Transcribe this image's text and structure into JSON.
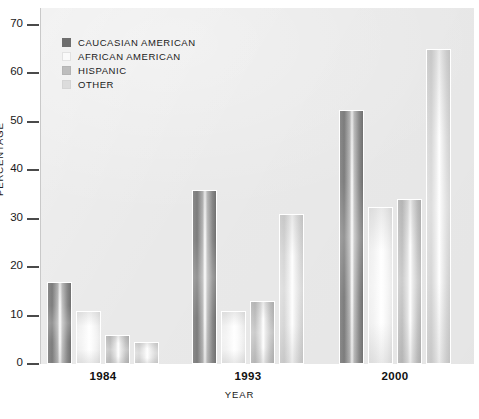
{
  "chart_data": {
    "type": "bar",
    "title": "",
    "xlabel": "YEAR",
    "ylabel": "PERCENTAGE",
    "categories": [
      "1984",
      "1993",
      "2000"
    ],
    "ylim": [
      0,
      70
    ],
    "yticks": [
      0,
      10,
      20,
      30,
      40,
      50,
      60,
      70
    ],
    "ytick_labels": [
      "0",
      "10",
      "20",
      "30",
      "40",
      "50",
      "60",
      "70"
    ],
    "grid": false,
    "legend_position": "upper-left-inside",
    "series": [
      {
        "name": "CAUCASIAN AMERICAN",
        "color": "#6e6e6e",
        "values": [
          17,
          36,
          52.5
        ]
      },
      {
        "name": "AFRICAN AMERICAN",
        "color": "#fafafa",
        "values": [
          11,
          11,
          32.5
        ]
      },
      {
        "name": "HISPANIC",
        "color": "#bdbdbd",
        "values": [
          6,
          13,
          34
        ]
      },
      {
        "name": "OTHER",
        "color": "#dcdcdc",
        "values": [
          4.5,
          31,
          65
        ]
      }
    ]
  },
  "legend": {
    "items": [
      {
        "label": "CAUCASIAN AMERICAN",
        "swatch_class": "sw-caucasian"
      },
      {
        "label": "AFRICAN AMERICAN",
        "swatch_class": "sw-african"
      },
      {
        "label": "HISPANIC",
        "swatch_class": "sw-hispanic"
      },
      {
        "label": "OTHER",
        "swatch_class": "sw-other"
      }
    ]
  },
  "axes": {
    "y_title": "PERCENTAGE",
    "x_title": "YEAR",
    "y_labels": [
      "70",
      "60",
      "50",
      "40",
      "30",
      "20",
      "10",
      "0"
    ],
    "x_labels": [
      "1984",
      "1993",
      "2000"
    ]
  },
  "caption": {
    "text": ""
  },
  "colors": {
    "panel_background": "#e9e9e9",
    "page_background": "#ffffff",
    "tick_color": "#4a4a4a",
    "text_color": "#1a1a1a",
    "bar_outline": "#ffffff"
  }
}
